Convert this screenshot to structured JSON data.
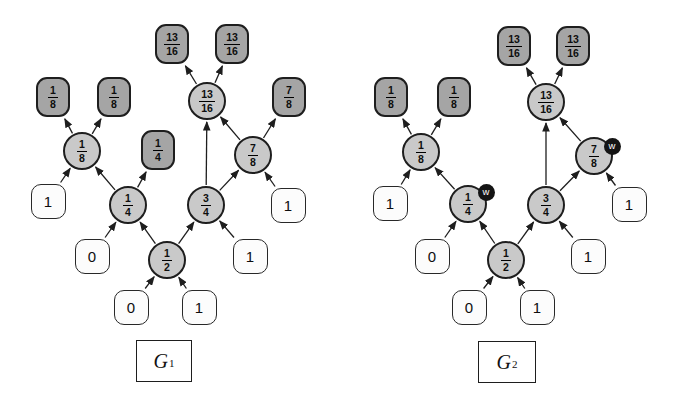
{
  "colors": {
    "background": "#ffffff",
    "output_square_fill": "#a5a5a5",
    "gate_circle_fill": "#c9c9c9",
    "input_square_fill": "#fcfcfc",
    "stroke": "#1e1e1e",
    "badge_fill": "#141414",
    "badge_text": "#ffffff"
  },
  "graphs": [
    {
      "id": "G1",
      "label": {
        "main": "G",
        "sub": "1"
      },
      "label_box": {
        "x": 164,
        "y": 361,
        "w": 56,
        "h": 42
      },
      "nodes": [
        {
          "id": "out-1-8-a",
          "kind": "output",
          "x": 53,
          "y": 97,
          "num": "1",
          "den": "8"
        },
        {
          "id": "out-1-8-b",
          "kind": "output",
          "x": 114,
          "y": 97,
          "num": "1",
          "den": "8"
        },
        {
          "id": "out-13-16-a",
          "kind": "output",
          "x": 172,
          "y": 44,
          "num": "13",
          "den": "16"
        },
        {
          "id": "out-13-16-b",
          "kind": "output",
          "x": 232,
          "y": 44,
          "num": "13",
          "den": "16"
        },
        {
          "id": "out-1-4",
          "kind": "output",
          "x": 158,
          "y": 150,
          "num": "1",
          "den": "4"
        },
        {
          "id": "out-7-8",
          "kind": "output",
          "x": 289,
          "y": 97,
          "num": "7",
          "den": "8"
        },
        {
          "id": "gate-1-8",
          "kind": "gate",
          "x": 82,
          "y": 151,
          "num": "1",
          "den": "8"
        },
        {
          "id": "gate-13-16",
          "kind": "gate",
          "x": 207,
          "y": 101,
          "num": "13",
          "den": "16"
        },
        {
          "id": "gate-7-8",
          "kind": "gate",
          "x": 253,
          "y": 155,
          "num": "7",
          "den": "8"
        },
        {
          "id": "gate-1-4",
          "kind": "gate",
          "x": 128,
          "y": 205,
          "num": "1",
          "den": "4"
        },
        {
          "id": "gate-3-4",
          "kind": "gate",
          "x": 206,
          "y": 205,
          "num": "3",
          "den": "4"
        },
        {
          "id": "gate-1-2",
          "kind": "gate",
          "x": 167,
          "y": 260,
          "num": "1",
          "den": "2"
        },
        {
          "id": "in-1-a",
          "kind": "input",
          "x": 48,
          "y": 201,
          "label": "1"
        },
        {
          "id": "in-0-a",
          "kind": "input",
          "x": 92,
          "y": 256,
          "label": "0"
        },
        {
          "id": "in-0-b",
          "kind": "input",
          "x": 131,
          "y": 307,
          "label": "0"
        },
        {
          "id": "in-1-b",
          "kind": "input",
          "x": 199,
          "y": 307,
          "label": "1"
        },
        {
          "id": "in-1-c",
          "kind": "input",
          "x": 250,
          "y": 256,
          "label": "1"
        },
        {
          "id": "in-1-d",
          "kind": "input",
          "x": 288,
          "y": 205,
          "label": "1"
        }
      ],
      "edges": [
        [
          "in-1-a",
          "gate-1-8"
        ],
        [
          "gate-1-4",
          "gate-1-8"
        ],
        [
          "in-0-a",
          "gate-1-4"
        ],
        [
          "gate-1-2",
          "gate-1-4"
        ],
        [
          "in-0-b",
          "gate-1-2"
        ],
        [
          "in-1-b",
          "gate-1-2"
        ],
        [
          "gate-1-2",
          "gate-3-4"
        ],
        [
          "in-1-c",
          "gate-3-4"
        ],
        [
          "gate-3-4",
          "gate-7-8"
        ],
        [
          "in-1-d",
          "gate-7-8"
        ],
        [
          "gate-3-4",
          "gate-13-16"
        ],
        [
          "gate-7-8",
          "gate-13-16"
        ],
        [
          "gate-1-8",
          "out-1-8-a"
        ],
        [
          "gate-1-8",
          "out-1-8-b"
        ],
        [
          "gate-1-4",
          "out-1-4"
        ],
        [
          "gate-7-8",
          "out-7-8"
        ],
        [
          "gate-13-16",
          "out-13-16-a"
        ],
        [
          "gate-13-16",
          "out-13-16-b"
        ]
      ]
    },
    {
      "id": "G2",
      "label": {
        "main": "G",
        "sub": "2"
      },
      "label_box": {
        "x": 507,
        "y": 362,
        "w": 58,
        "h": 42
      },
      "nodes": [
        {
          "id": "out-1-8-a",
          "kind": "output",
          "x": 391,
          "y": 97,
          "num": "1",
          "den": "8"
        },
        {
          "id": "out-1-8-b",
          "kind": "output",
          "x": 454,
          "y": 97,
          "num": "1",
          "den": "8"
        },
        {
          "id": "out-13-16-a",
          "kind": "output",
          "x": 514,
          "y": 46,
          "num": "13",
          "den": "16"
        },
        {
          "id": "out-13-16-b",
          "kind": "output",
          "x": 573,
          "y": 46,
          "num": "13",
          "den": "16"
        },
        {
          "id": "gate-1-8",
          "kind": "gate",
          "x": 421,
          "y": 152,
          "num": "1",
          "den": "8"
        },
        {
          "id": "gate-13-16",
          "kind": "gate",
          "x": 546,
          "y": 102,
          "num": "13",
          "den": "16"
        },
        {
          "id": "gate-7-8",
          "kind": "gate",
          "x": 594,
          "y": 156,
          "num": "7",
          "den": "8",
          "badge": "w",
          "badge_dx": 18,
          "badge_dy": -10
        },
        {
          "id": "gate-1-4",
          "kind": "gate",
          "x": 468,
          "y": 204,
          "num": "1",
          "den": "4",
          "badge": "w",
          "badge_dx": 18,
          "badge_dy": -12
        },
        {
          "id": "gate-3-4",
          "kind": "gate",
          "x": 546,
          "y": 205,
          "num": "3",
          "den": "4"
        },
        {
          "id": "gate-1-2",
          "kind": "gate",
          "x": 506,
          "y": 260,
          "num": "1",
          "den": "2"
        },
        {
          "id": "in-1-a",
          "kind": "input",
          "x": 390,
          "y": 203,
          "label": "1"
        },
        {
          "id": "in-0-a",
          "kind": "input",
          "x": 432,
          "y": 256,
          "label": "0"
        },
        {
          "id": "in-0-b",
          "kind": "input",
          "x": 469,
          "y": 307,
          "label": "0"
        },
        {
          "id": "in-1-b",
          "kind": "input",
          "x": 537,
          "y": 307,
          "label": "1"
        },
        {
          "id": "in-1-c",
          "kind": "input",
          "x": 588,
          "y": 256,
          "label": "1"
        },
        {
          "id": "in-1-d",
          "kind": "input",
          "x": 629,
          "y": 204,
          "label": "1"
        }
      ],
      "edges": [
        [
          "in-1-a",
          "gate-1-8"
        ],
        [
          "gate-1-4",
          "gate-1-8"
        ],
        [
          "in-0-a",
          "gate-1-4"
        ],
        [
          "gate-1-2",
          "gate-1-4"
        ],
        [
          "in-0-b",
          "gate-1-2"
        ],
        [
          "in-1-b",
          "gate-1-2"
        ],
        [
          "gate-1-2",
          "gate-3-4"
        ],
        [
          "in-1-c",
          "gate-3-4"
        ],
        [
          "gate-3-4",
          "gate-7-8"
        ],
        [
          "in-1-d",
          "gate-7-8"
        ],
        [
          "gate-3-4",
          "gate-13-16"
        ],
        [
          "gate-7-8",
          "gate-13-16"
        ],
        [
          "gate-1-8",
          "out-1-8-a"
        ],
        [
          "gate-1-8",
          "out-1-8-b"
        ],
        [
          "gate-13-16",
          "out-13-16-a"
        ],
        [
          "gate-13-16",
          "out-13-16-b"
        ]
      ]
    }
  ]
}
